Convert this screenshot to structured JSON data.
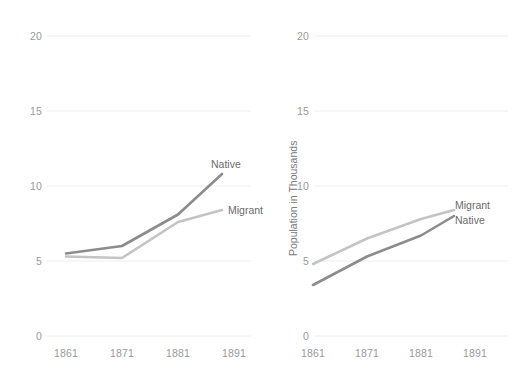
{
  "chart_data": [
    {
      "panel": "left",
      "type": "line",
      "title": "",
      "xlabel": "",
      "ylabel": "",
      "x": [
        1861,
        1871,
        1881,
        1891
      ],
      "categories": [
        "1861",
        "1871",
        "1881",
        "1891"
      ],
      "xtick_labels": [
        "1861",
        "1871",
        "1881",
        "1891"
      ],
      "ytick_labels": [
        "0",
        "5",
        "10",
        "15",
        "20"
      ],
      "ytick_values": [
        0,
        5,
        10,
        15,
        20
      ],
      "ylim": [
        0,
        20
      ],
      "grid": "horizontal",
      "legend_position": "inline-right",
      "series": [
        {
          "name": "Native",
          "values": [
            5.5,
            6.0,
            8.1,
            10.8
          ],
          "color": "#8c8c8c"
        },
        {
          "name": "Migrant",
          "values": [
            5.3,
            5.2,
            7.6,
            8.4
          ],
          "color": "#c4c4c4"
        }
      ]
    },
    {
      "panel": "right",
      "type": "line",
      "title": "",
      "xlabel": "",
      "ylabel": "Population in Thousands",
      "x": [
        1861,
        1871,
        1881,
        1891
      ],
      "categories": [
        "1861",
        "1871",
        "1881",
        "1891"
      ],
      "xtick_labels": [
        "1861",
        "1871",
        "1881",
        "1891"
      ],
      "ytick_labels": [
        "0",
        "5",
        "10",
        "15",
        "20"
      ],
      "ytick_values": [
        0,
        5,
        10,
        15,
        20
      ],
      "ylim": [
        0,
        20
      ],
      "grid": "horizontal",
      "legend_position": "inline-right",
      "series": [
        {
          "name": "Migrant",
          "values": [
            4.8,
            6.5,
            7.8,
            8.4
          ],
          "color": "#c4c4c4"
        },
        {
          "name": "Native",
          "values": [
            3.4,
            5.3,
            6.7,
            8.0
          ],
          "color": "#8c8c8c"
        }
      ]
    }
  ],
  "left_chart": {
    "yticks": [
      "20",
      "15",
      "10",
      "5",
      "0"
    ],
    "xticks": [
      "1861",
      "1871",
      "1881",
      "1891"
    ],
    "labels": {
      "native": "Native",
      "migrant": "Migrant"
    }
  },
  "right_chart": {
    "yticks": [
      "20",
      "15",
      "10",
      "5",
      "0"
    ],
    "xticks": [
      "1861",
      "1871",
      "1881",
      "1891"
    ],
    "axis_title_y": "Population in Thousands",
    "labels": {
      "migrant": "Migrant",
      "native": "Native"
    }
  },
  "colors": {
    "native_line": "#8c8c8c",
    "migrant_line": "#c4c4c4",
    "gridline": "#eeeeee",
    "tick_text": "#9a9a9a",
    "label_text": "#6b6b6b",
    "background": "#ffffff"
  }
}
